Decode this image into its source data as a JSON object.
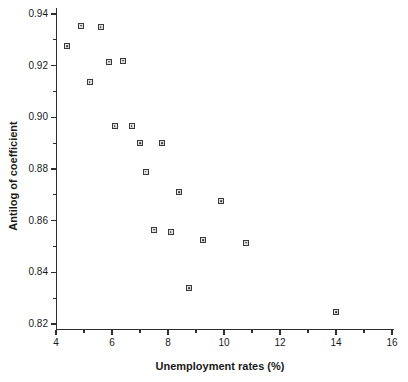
{
  "figure": {
    "background_color": "#ffffff",
    "axis_color": "#2e2e2e",
    "text_color": "#1a1a1a",
    "marker_border_color": "#3a3a3a",
    "marker_fill_color": "#e2e2e2"
  },
  "chart_data": {
    "type": "scatter",
    "title": "",
    "xlabel": "Unemployment rates (%)",
    "ylabel": "Antilog of coefficient",
    "xlim": [
      4,
      16
    ],
    "ylim": [
      0.82,
      0.94
    ],
    "x_major_ticks": [
      4,
      6,
      8,
      10,
      12,
      14,
      16
    ],
    "x_minor_ticks": [
      5,
      7,
      9,
      11,
      13,
      15
    ],
    "y_major_ticks": [
      0.94,
      0.92,
      0.9,
      0.88,
      0.86,
      0.84,
      0.82
    ],
    "y_minor_ticks": [
      0.93,
      0.91,
      0.89,
      0.87,
      0.85,
      0.83
    ],
    "y_tick_decimals": 2,
    "grid": false,
    "legend": null,
    "marker_shape": "square-with-center-dot",
    "points": [
      {
        "x": 4.4,
        "y": 0.9275
      },
      {
        "x": 4.9,
        "y": 0.9355
      },
      {
        "x": 5.2,
        "y": 0.9135
      },
      {
        "x": 5.6,
        "y": 0.935
      },
      {
        "x": 5.9,
        "y": 0.9215
      },
      {
        "x": 6.1,
        "y": 0.8965
      },
      {
        "x": 6.4,
        "y": 0.922
      },
      {
        "x": 6.7,
        "y": 0.8965
      },
      {
        "x": 7.0,
        "y": 0.89
      },
      {
        "x": 7.2,
        "y": 0.879
      },
      {
        "x": 7.5,
        "y": 0.8565
      },
      {
        "x": 7.8,
        "y": 0.89
      },
      {
        "x": 8.1,
        "y": 0.8555
      },
      {
        "x": 8.4,
        "y": 0.871
      },
      {
        "x": 8.75,
        "y": 0.834
      },
      {
        "x": 9.25,
        "y": 0.8525
      },
      {
        "x": 9.9,
        "y": 0.8675
      },
      {
        "x": 10.8,
        "y": 0.8515
      },
      {
        "x": 14.0,
        "y": 0.8245
      }
    ]
  }
}
